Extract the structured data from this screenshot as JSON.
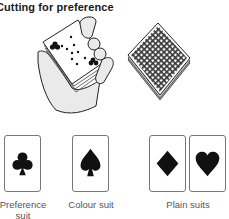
{
  "title": "Cutting for preference",
  "illustrations": {
    "hand": "hand-holding-cards",
    "deck": "face-down-deck"
  },
  "suits": [
    {
      "name": "club",
      "label": "Preference suit"
    },
    {
      "name": "spade",
      "label": "Colour suit"
    },
    {
      "name": "diamond",
      "label": ""
    },
    {
      "name": "heart",
      "label": ""
    }
  ],
  "labels": {
    "preference": "Preference suit",
    "colour": "Colour suit",
    "plain": "Plain suits"
  },
  "colors": {
    "ink": "#1a1a1a",
    "card_border": "#777777"
  }
}
